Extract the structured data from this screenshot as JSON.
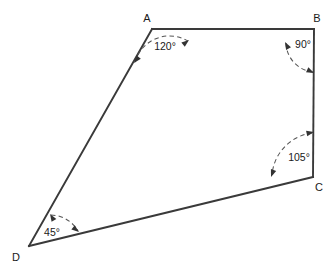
{
  "figure": {
    "type": "geometry-diagram",
    "shape": "quadrilateral",
    "background_color": "#ffffff",
    "line_color": "#3a3a3a",
    "arc_color": "#555555",
    "label_color": "#1a1a1a"
  },
  "vertices": [
    {
      "name": "A",
      "label": "A",
      "x": 152,
      "y": 29,
      "label_x": 147,
      "label_y": 22
    },
    {
      "name": "B",
      "label": "B",
      "x": 314,
      "y": 29,
      "label_x": 317,
      "label_y": 22
    },
    {
      "name": "C",
      "label": "C",
      "x": 313,
      "y": 177,
      "label_x": 318,
      "label_y": 190
    },
    {
      "name": "D",
      "label": "D",
      "x": 29,
      "y": 246,
      "label_x": 15,
      "label_y": 260
    }
  ],
  "edges": [
    {
      "name": "AB",
      "from": "A",
      "to": "B"
    },
    {
      "name": "BC",
      "from": "B",
      "to": "C"
    },
    {
      "name": "CD",
      "from": "C",
      "to": "D"
    },
    {
      "name": "DA",
      "from": "D",
      "to": "A"
    }
  ],
  "angles": [
    {
      "vertex": "A",
      "value": "120°",
      "degrees": 120,
      "label_x": 165,
      "label_y": 50
    },
    {
      "vertex": "B",
      "value": "90°",
      "degrees": 90,
      "label_x": 302,
      "label_y": 48
    },
    {
      "vertex": "C",
      "value": "105°",
      "degrees": 105,
      "label_x": 299,
      "label_y": 161
    },
    {
      "vertex": "D",
      "value": "45°",
      "degrees": 45,
      "label_x": 51,
      "label_y": 236
    }
  ],
  "arcs": {
    "A": {
      "path": "M 135 62 A 36 36 0 0 1 188 41",
      "start_arrow": {
        "x": 135,
        "y": 62,
        "angle": 118
      },
      "end_arrow": {
        "x": 188,
        "y": 41,
        "angle": -30
      }
    },
    "B": {
      "path": "M 286 43 A 30 30 0 0 0 313 72",
      "start_arrow": {
        "x": 286,
        "y": 43,
        "angle": -62
      },
      "end_arrow": {
        "x": 313,
        "y": 72,
        "angle": 62
      }
    },
    "C": {
      "path": "M 313 134 A 46 46 0 0 0 273 174",
      "start_arrow": {
        "x": 313,
        "y": 134,
        "angle": -4
      },
      "end_arrow": {
        "x": 273,
        "y": 174,
        "angle": 117
      }
    },
    "D": {
      "path": "M 50 216 A 32 32 0 0 1 76 231",
      "start_arrow": {
        "x": 50,
        "y": 216,
        "angle": -57
      },
      "end_arrow": {
        "x": 76,
        "y": 231,
        "angle": 32
      }
    }
  }
}
